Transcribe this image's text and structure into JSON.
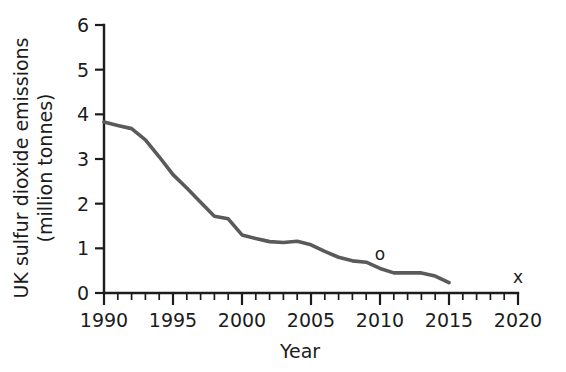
{
  "chart_data": {
    "type": "line",
    "title": "",
    "xlabel": "Year",
    "ylabel": "UK sulfur dioxide emissions (million tonnes)",
    "ylabel_line1": "UK sulfur dioxide emissions",
    "ylabel_line2": "(million tonnes)",
    "xlim": [
      1990,
      2020
    ],
    "ylim": [
      0,
      6
    ],
    "grid": false,
    "legend": "none",
    "x_major_ticks": [
      1990,
      1995,
      2000,
      2005,
      2010,
      2015,
      2020
    ],
    "x_major_tick_labels": [
      "1990",
      "1995",
      "2000",
      "2005",
      "2010",
      "2015",
      "2020"
    ],
    "x_minor_tick_interval": 1,
    "y_major_ticks": [
      0,
      1,
      2,
      3,
      4,
      5,
      6
    ],
    "y_major_tick_labels": [
      "0",
      "1",
      "2",
      "3",
      "4",
      "5",
      "6"
    ],
    "series": [
      {
        "name": "UK sulfur dioxide emissions",
        "color": "#5a5a5a",
        "x": [
          1990,
          1991,
          1992,
          1993,
          1994,
          1995,
          1996,
          1997,
          1998,
          1999,
          2000,
          2001,
          2002,
          2003,
          2004,
          2005,
          2006,
          2007,
          2008,
          2009,
          2010,
          2011,
          2012,
          2013,
          2014,
          2015
        ],
        "values": [
          3.83,
          3.75,
          3.68,
          3.43,
          3.05,
          2.65,
          2.35,
          2.03,
          1.72,
          1.66,
          1.3,
          1.22,
          1.15,
          1.13,
          1.16,
          1.08,
          0.93,
          0.8,
          0.72,
          0.69,
          0.55,
          0.45,
          0.45,
          0.45,
          0.38,
          0.23
        ]
      }
    ],
    "annotations": [
      {
        "text": "o",
        "x": 2010,
        "y": 0.73,
        "name": "marker-o"
      },
      {
        "text": "x",
        "x": 2020,
        "y": 0.23,
        "name": "marker-x"
      }
    ]
  },
  "colors": {
    "line": "#5a5a5a",
    "axis": "#1c1c1c",
    "background": "#ffffff"
  }
}
